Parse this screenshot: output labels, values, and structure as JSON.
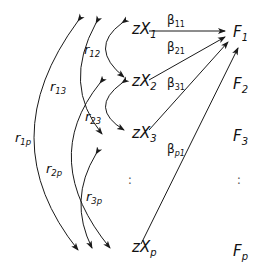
{
  "diagram": {
    "type": "path-diagram",
    "predictors": [
      {
        "id": "zx1",
        "base": "z",
        "var": "X",
        "sub": "1"
      },
      {
        "id": "zx2",
        "base": "z",
        "var": "X",
        "sub": "2"
      },
      {
        "id": "zx3",
        "base": "z",
        "var": "X",
        "sub": "3"
      },
      {
        "id": "zxp",
        "base": "z",
        "var": "X",
        "sub": "p"
      }
    ],
    "factors": [
      {
        "id": "F1",
        "base": "F",
        "sub": "1"
      },
      {
        "id": "F2",
        "base": "F",
        "sub": "2"
      },
      {
        "id": "F3",
        "base": "F",
        "sub": "3"
      },
      {
        "id": "Fp",
        "base": "F",
        "sub": "p"
      }
    ],
    "ellipsis": "⋮",
    "correlations": [
      {
        "from": "zx1",
        "to": "zx2",
        "label": "r",
        "sub": "12"
      },
      {
        "from": "zx1",
        "to": "zx3",
        "label": "r",
        "sub": "13"
      },
      {
        "from": "zx2",
        "to": "zx3",
        "label": "r",
        "sub": "23"
      },
      {
        "from": "zx1",
        "to": "zxp",
        "label": "r",
        "sub": "1p"
      },
      {
        "from": "zx2",
        "to": "zxp",
        "label": "r",
        "sub": "2p"
      },
      {
        "from": "zx3",
        "to": "zxp",
        "label": "r",
        "sub": "3p"
      }
    ],
    "paths": [
      {
        "from": "zx1",
        "to": "F1",
        "label": "β",
        "sub": "11"
      },
      {
        "from": "zx2",
        "to": "F1",
        "label": "β",
        "sub": "21"
      },
      {
        "from": "zx3",
        "to": "F1",
        "label": "β",
        "sub": "31"
      },
      {
        "from": "zxp",
        "to": "F1",
        "label": "β",
        "sub": "p1"
      }
    ],
    "line_color": "#1a1a1a"
  }
}
